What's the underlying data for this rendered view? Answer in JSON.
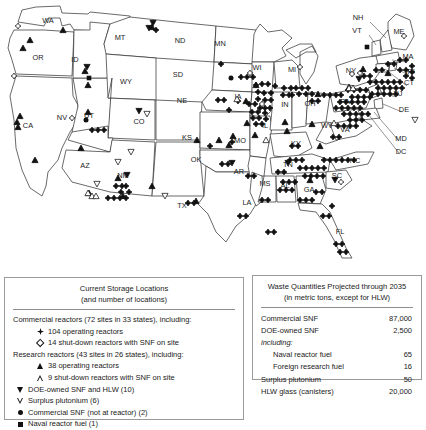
{
  "map": {
    "title": "US nuclear waste current storage locations map",
    "state_labels": [
      {
        "abbr": "WA",
        "x": 48,
        "y": 23
      },
      {
        "abbr": "OR",
        "x": 38,
        "y": 60
      },
      {
        "abbr": "CA",
        "x": 28,
        "y": 128
      },
      {
        "abbr": "NV",
        "x": 62,
        "y": 120
      },
      {
        "abbr": "ID",
        "x": 75,
        "y": 62
      },
      {
        "abbr": "MT",
        "x": 120,
        "y": 40
      },
      {
        "abbr": "WY",
        "x": 126,
        "y": 84
      },
      {
        "abbr": "UT",
        "x": 89,
        "y": 118
      },
      {
        "abbr": "AZ",
        "x": 85,
        "y": 168
      },
      {
        "abbr": "CO",
        "x": 139,
        "y": 124
      },
      {
        "abbr": "NM",
        "x": 123,
        "y": 178
      },
      {
        "abbr": "ND",
        "x": 180,
        "y": 43
      },
      {
        "abbr": "SD",
        "x": 178,
        "y": 77
      },
      {
        "abbr": "NE",
        "x": 182,
        "y": 103
      },
      {
        "abbr": "KS",
        "x": 187,
        "y": 140
      },
      {
        "abbr": "OK",
        "x": 196,
        "y": 162
      },
      {
        "abbr": "TX",
        "x": 182,
        "y": 208
      },
      {
        "abbr": "MN",
        "x": 220,
        "y": 46
      },
      {
        "abbr": "IA",
        "x": 238,
        "y": 99
      },
      {
        "abbr": "MO",
        "x": 240,
        "y": 143
      },
      {
        "abbr": "AR",
        "x": 239,
        "y": 174
      },
      {
        "abbr": "LA",
        "x": 247,
        "y": 205
      },
      {
        "abbr": "MS",
        "x": 265,
        "y": 186
      },
      {
        "abbr": "AL",
        "x": 285,
        "y": 188
      },
      {
        "abbr": "GA",
        "x": 309,
        "y": 192
      },
      {
        "abbr": "FL",
        "x": 340,
        "y": 234
      },
      {
        "abbr": "WI",
        "x": 257,
        "y": 70
      },
      {
        "abbr": "MI",
        "x": 292,
        "y": 72
      },
      {
        "abbr": "IL",
        "x": 265,
        "y": 128
      },
      {
        "abbr": "IN",
        "x": 285,
        "y": 107
      },
      {
        "abbr": "OH",
        "x": 310,
        "y": 106
      },
      {
        "abbr": "KY",
        "x": 296,
        "y": 146
      },
      {
        "abbr": "TN",
        "x": 288,
        "y": 167
      },
      {
        "abbr": "WV",
        "x": 327,
        "y": 128
      },
      {
        "abbr": "VA",
        "x": 345,
        "y": 132
      },
      {
        "abbr": "NC",
        "x": 355,
        "y": 163
      },
      {
        "abbr": "SC",
        "x": 337,
        "y": 178
      },
      {
        "abbr": "PA",
        "x": 345,
        "y": 104
      },
      {
        "abbr": "NY",
        "x": 351,
        "y": 73
      },
      {
        "abbr": "ME",
        "x": 399,
        "y": 34
      },
      {
        "abbr": "NH",
        "x": 358,
        "y": 20
      },
      {
        "abbr": "VT",
        "x": 357,
        "y": 33
      },
      {
        "abbr": "MA",
        "x": 408,
        "y": 59
      },
      {
        "abbr": "RI",
        "x": 411,
        "y": 74
      },
      {
        "abbr": "CT",
        "x": 409,
        "y": 85
      },
      {
        "abbr": "NJ",
        "x": 398,
        "y": 96
      },
      {
        "abbr": "DE",
        "x": 404,
        "y": 112
      },
      {
        "abbr": "MD",
        "x": 401,
        "y": 141
      },
      {
        "abbr": "DC",
        "x": 401,
        "y": 154
      }
    ]
  },
  "storage_legend": {
    "title_line1": "Current Storage Locations",
    "title_line2": "(and number of locations)",
    "groups": [
      {
        "heading": "Commercial reactors (72 sites in 33 states), including:",
        "items": [
          {
            "symbol": "filled-diamond",
            "label": "104 operating reactors"
          },
          {
            "symbol": "open-diamond",
            "label": "14 shut-down reactors with SNF on site"
          }
        ]
      },
      {
        "heading": "Research reactors (43 sites in 26 states), including:",
        "items": [
          {
            "symbol": "filled-triangle-up",
            "label": "38 operating reactors"
          },
          {
            "symbol": "open-triangle-up",
            "label": "9 shut-down reactors with SNF on site"
          }
        ]
      }
    ],
    "flat_items": [
      {
        "symbol": "filled-triangle-down",
        "label": "DOE-owned SNF and HLW (10)"
      },
      {
        "symbol": "open-triangle-down",
        "label": "Surplus plutonium (6)"
      },
      {
        "symbol": "filled-circle",
        "label": "Commercial SNF (not at reactor) (2)"
      },
      {
        "symbol": "filled-square",
        "label": "Naval reactor fuel (1)"
      }
    ]
  },
  "quantities_panel": {
    "title_line1": "Waste Quantities Projected through 2035",
    "title_line2": "(in metric tons, except for HLW)",
    "rows": [
      {
        "label": "Commercial SNF",
        "value": "87,000",
        "style": "normal"
      },
      {
        "label": "DOE-owned SNF",
        "value": "2,500",
        "style": "normal"
      },
      {
        "label": "including:",
        "value": "",
        "style": "including"
      },
      {
        "label": "Naval reactor fuel",
        "value": "65",
        "style": "sub"
      },
      {
        "label": "Foreign research fuel",
        "value": "16",
        "style": "sub"
      },
      {
        "label": "Surplus plutonium",
        "value": "50",
        "style": "normal"
      },
      {
        "label": "HLW glass (canisters)",
        "value": "20,000",
        "style": "normal"
      }
    ]
  },
  "markers": {
    "filled_diamond": [
      [
        156,
        30
      ],
      [
        221,
        64
      ],
      [
        241,
        77
      ],
      [
        247,
        77
      ],
      [
        253,
        77
      ],
      [
        256,
        85
      ],
      [
        262,
        84
      ],
      [
        268,
        84
      ],
      [
        275,
        86
      ],
      [
        291,
        88
      ],
      [
        296,
        88
      ],
      [
        302,
        88
      ],
      [
        308,
        88
      ],
      [
        258,
        92
      ],
      [
        264,
        93
      ],
      [
        271,
        93
      ],
      [
        283,
        95
      ],
      [
        289,
        95
      ],
      [
        258,
        99
      ],
      [
        265,
        100
      ],
      [
        271,
        100
      ],
      [
        249,
        104
      ],
      [
        255,
        104
      ],
      [
        260,
        108
      ],
      [
        265,
        108
      ],
      [
        270,
        108
      ],
      [
        252,
        112
      ],
      [
        258,
        112
      ],
      [
        265,
        113
      ],
      [
        253,
        118
      ],
      [
        259,
        118
      ],
      [
        266,
        119
      ],
      [
        256,
        124
      ],
      [
        262,
        124
      ],
      [
        218,
        100
      ],
      [
        224,
        100
      ],
      [
        229,
        110
      ],
      [
        232,
        142
      ],
      [
        238,
        101
      ],
      [
        284,
        88
      ],
      [
        292,
        95
      ],
      [
        299,
        94
      ],
      [
        306,
        94
      ],
      [
        312,
        94
      ],
      [
        312,
        101
      ],
      [
        318,
        101
      ],
      [
        324,
        95
      ],
      [
        330,
        95
      ],
      [
        336,
        95
      ],
      [
        341,
        95
      ],
      [
        348,
        90
      ],
      [
        354,
        90
      ],
      [
        360,
        90
      ],
      [
        366,
        90
      ],
      [
        352,
        97
      ],
      [
        358,
        97
      ],
      [
        364,
        97
      ],
      [
        370,
        97
      ],
      [
        340,
        102
      ],
      [
        346,
        102
      ],
      [
        352,
        102
      ],
      [
        358,
        102
      ],
      [
        364,
        102
      ],
      [
        336,
        108
      ],
      [
        342,
        108
      ],
      [
        348,
        108
      ],
      [
        354,
        108
      ],
      [
        360,
        108
      ],
      [
        370,
        82
      ],
      [
        376,
        82
      ],
      [
        382,
        82
      ],
      [
        388,
        82
      ],
      [
        394,
        82
      ],
      [
        400,
        82
      ],
      [
        378,
        88
      ],
      [
        384,
        88
      ],
      [
        390,
        88
      ],
      [
        396,
        88
      ],
      [
        402,
        88
      ],
      [
        372,
        94
      ],
      [
        378,
        94
      ],
      [
        384,
        94
      ],
      [
        390,
        94
      ],
      [
        396,
        94
      ],
      [
        364,
        76
      ],
      [
        370,
        76
      ],
      [
        376,
        70
      ],
      [
        382,
        70
      ],
      [
        388,
        64
      ],
      [
        394,
        64
      ],
      [
        400,
        60
      ],
      [
        406,
        60
      ],
      [
        412,
        66
      ],
      [
        400,
        70
      ],
      [
        406,
        70
      ],
      [
        412,
        72
      ],
      [
        406,
        76
      ],
      [
        412,
        78
      ],
      [
        344,
        114
      ],
      [
        350,
        114
      ],
      [
        356,
        114
      ],
      [
        362,
        114
      ],
      [
        368,
        114
      ],
      [
        350,
        120
      ],
      [
        356,
        120
      ],
      [
        362,
        120
      ],
      [
        338,
        126
      ],
      [
        344,
        126
      ],
      [
        350,
        126
      ],
      [
        356,
        126
      ],
      [
        324,
        160
      ],
      [
        330,
        160
      ],
      [
        336,
        160
      ],
      [
        342,
        160
      ],
      [
        348,
        160
      ],
      [
        354,
        160
      ],
      [
        300,
        168
      ],
      [
        306,
        168
      ],
      [
        312,
        168
      ],
      [
        318,
        168
      ],
      [
        324,
        168
      ],
      [
        305,
        176
      ],
      [
        311,
        176
      ],
      [
        317,
        176
      ],
      [
        323,
        176
      ],
      [
        283,
        182
      ],
      [
        289,
        182
      ],
      [
        295,
        182
      ],
      [
        280,
        190
      ],
      [
        286,
        190
      ],
      [
        292,
        190
      ],
      [
        300,
        200
      ],
      [
        306,
        200
      ],
      [
        312,
        200
      ],
      [
        278,
        172
      ],
      [
        284,
        172
      ],
      [
        248,
        176
      ],
      [
        254,
        176
      ],
      [
        222,
        164
      ],
      [
        228,
        164
      ],
      [
        262,
        200
      ],
      [
        268,
        200
      ],
      [
        240,
        216
      ],
      [
        246,
        216
      ],
      [
        188,
        203
      ],
      [
        194,
        203
      ],
      [
        268,
        232
      ],
      [
        274,
        232
      ],
      [
        323,
        216
      ],
      [
        329,
        216
      ],
      [
        336,
        244
      ],
      [
        342,
        244
      ],
      [
        340,
        252
      ],
      [
        346,
        252
      ],
      [
        332,
        206
      ],
      [
        92,
        130
      ],
      [
        98,
        130
      ],
      [
        104,
        130
      ],
      [
        116,
        186
      ],
      [
        122,
        186
      ],
      [
        126,
        186
      ],
      [
        121,
        192
      ],
      [
        129,
        192
      ],
      [
        108,
        198
      ],
      [
        114,
        198
      ],
      [
        120,
        198
      ],
      [
        126,
        198
      ],
      [
        290,
        160
      ],
      [
        296,
        160
      ],
      [
        302,
        160
      ],
      [
        316,
        192
      ],
      [
        322,
        192
      ],
      [
        333,
        137
      ],
      [
        339,
        137
      ],
      [
        292,
        146
      ],
      [
        298,
        146
      ],
      [
        210,
        146
      ]
    ],
    "open_diamond": [
      [
        18,
        26
      ],
      [
        14,
        76
      ],
      [
        72,
        118
      ],
      [
        250,
        73
      ],
      [
        262,
        104
      ],
      [
        352,
        74
      ],
      [
        360,
        73
      ],
      [
        404,
        36
      ],
      [
        341,
        182
      ],
      [
        300,
        67
      ]
    ],
    "filled_triangle": [
      [
        152,
        27
      ],
      [
        63,
        30
      ],
      [
        30,
        40
      ],
      [
        23,
        48
      ],
      [
        85,
        71
      ],
      [
        88,
        85
      ],
      [
        88,
        112
      ],
      [
        20,
        116
      ],
      [
        17,
        122
      ],
      [
        18,
        127
      ],
      [
        35,
        160
      ],
      [
        89,
        193
      ],
      [
        123,
        196
      ],
      [
        118,
        178
      ],
      [
        256,
        85
      ],
      [
        318,
        94
      ],
      [
        285,
        122
      ],
      [
        312,
        124
      ],
      [
        219,
        140
      ],
      [
        233,
        136
      ],
      [
        320,
        146
      ],
      [
        310,
        180
      ],
      [
        196,
        201
      ],
      [
        152,
        186
      ],
      [
        255,
        135
      ],
      [
        81,
        148
      ],
      [
        247,
        123
      ],
      [
        349,
        87
      ],
      [
        363,
        69
      ],
      [
        388,
        73
      ],
      [
        246,
        101
      ],
      [
        287,
        131
      ],
      [
        229,
        145
      ],
      [
        197,
        140
      ]
    ],
    "open_triangle": [
      [
        88,
        193
      ],
      [
        92,
        196
      ],
      [
        96,
        196
      ],
      [
        237,
        99
      ],
      [
        266,
        140
      ],
      [
        334,
        123
      ],
      [
        349,
        88
      ],
      [
        353,
        88
      ]
    ],
    "filled_triangle_down": [
      [
        153,
        23
      ],
      [
        87,
        67
      ],
      [
        139,
        111
      ],
      [
        127,
        175
      ],
      [
        359,
        79
      ],
      [
        288,
        163
      ],
      [
        335,
        180
      ],
      [
        149,
        28
      ],
      [
        232,
        163
      ]
    ],
    "open_triangle_down": [
      [
        147,
        114
      ],
      [
        131,
        152
      ],
      [
        118,
        162
      ],
      [
        97,
        184
      ],
      [
        165,
        196
      ],
      [
        415,
        120
      ]
    ],
    "filled_circle": [
      [
        86,
        120
      ],
      [
        231,
        78
      ]
    ],
    "filled_square": [
      [
        89,
        78
      ],
      [
        367,
        47
      ]
    ]
  }
}
